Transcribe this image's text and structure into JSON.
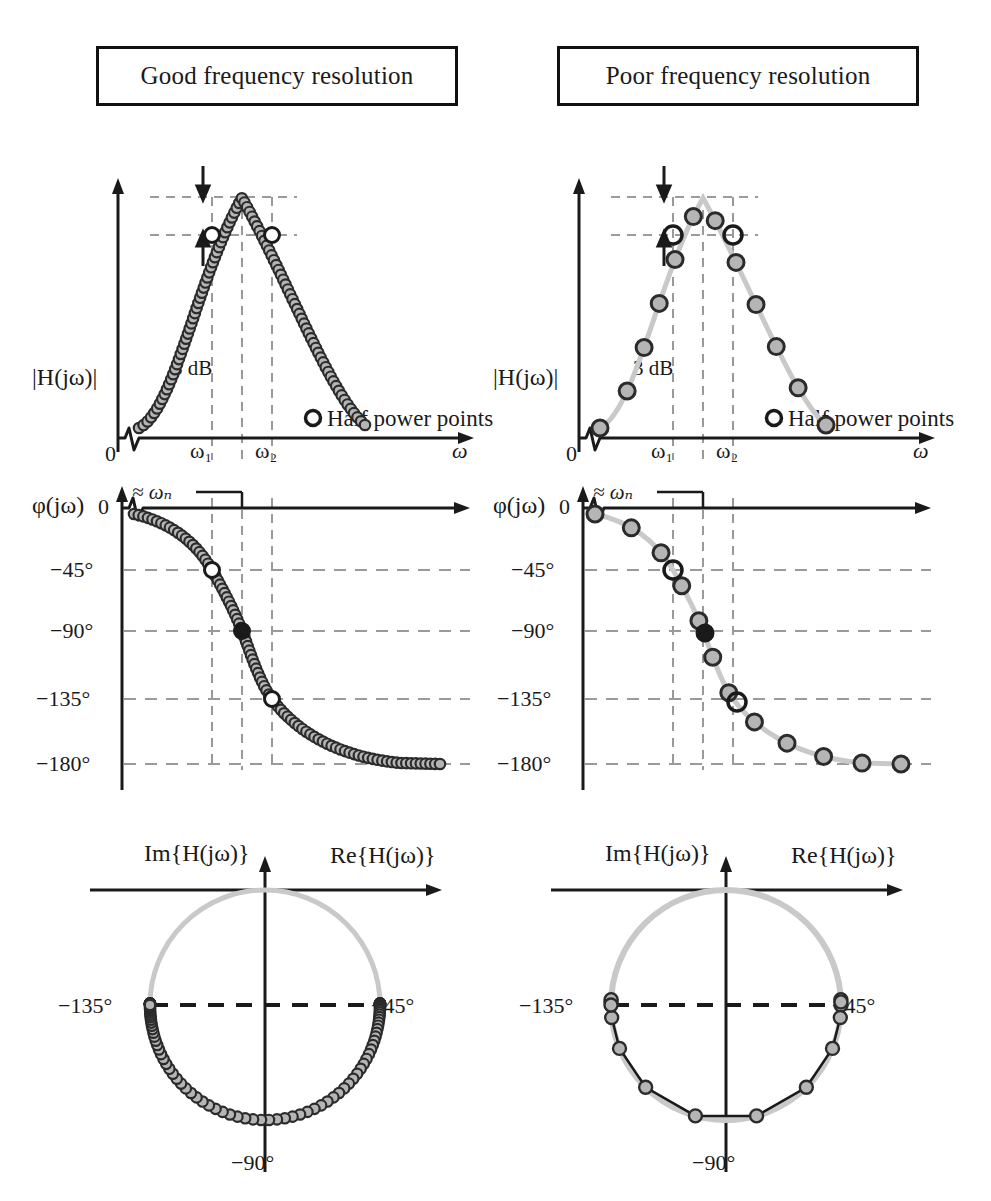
{
  "figure": {
    "kind": "two-column frequency-response comparison",
    "columns": [
      {
        "title": "Good frequency resolution"
      },
      {
        "title": "Poor frequency resolution"
      }
    ]
  },
  "labels": {
    "magnitude_axis": "|H(jω)|",
    "phase_axis": "φ(jω)",
    "omega_axis": "ω",
    "omega_1": "ω₁",
    "omega_2": "ω₂",
    "zero": "0",
    "phase_zero": "0",
    "three_db": "3 dB",
    "approx_wn": "≈ ωₙ",
    "legend_half_power": "Half power points",
    "im_axis": "Im{H(jω)}",
    "re_axis": "Re{H(jω)}",
    "deg_45": "−45°",
    "deg_90": "−90°",
    "deg_135": "−135°",
    "deg_180": "−180°"
  },
  "colors": {
    "ink": "#1a1a1a",
    "curve_light": "#c9c9c9",
    "marker_fill": "#b5b5b5",
    "marker_edge": "#2b2b2b",
    "grid_dash": "#9a9a9a",
    "highlight_fill": "#ffffff",
    "dark_marker": "#1a1a1a"
  },
  "chart_data": [
    {
      "id": "magnitude-good",
      "type": "line",
      "title": "Good frequency resolution — magnitude",
      "xlabel": "ω",
      "ylabel": "|H(jω)|",
      "xtick_labels": [
        "0",
        "ω₁",
        "ω₂",
        "ω"
      ],
      "annotations": [
        "3 dB",
        "Half power points"
      ],
      "resonance_shape": "lightly damped second-order peak",
      "sample_count": 96,
      "half_power_x": [
        0.4,
        0.56
      ],
      "peak_x": 0.48,
      "half_power_level": 0.707,
      "peak_level": 1.0,
      "notes": "dense sampling resolves the peak and both half-power points"
    },
    {
      "id": "magnitude-poor",
      "type": "line",
      "title": "Poor frequency resolution — magnitude",
      "xlabel": "ω",
      "ylabel": "|H(jω)|",
      "xtick_labels": [
        "0",
        "ω₁",
        "ω₂",
        "ω"
      ],
      "annotations": [
        "3 dB",
        "Half power points"
      ],
      "sample_count": 12,
      "half_power_x": [
        0.4,
        0.56
      ],
      "peak_x": 0.48,
      "half_power_level": 0.707,
      "peak_level": 1.0,
      "notes": "coarse sampling misses the true peak; samples straddle the 3 dB band"
    },
    {
      "id": "phase-good",
      "type": "line",
      "title": "Good frequency resolution — phase",
      "xlabel": "ω",
      "ylabel": "φ(jω)",
      "ytick_labels": [
        "0",
        "−45°",
        "−90°",
        "−135°",
        "−180°"
      ],
      "ylim": [
        -180,
        0
      ],
      "grid": true,
      "annotations": [
        "≈ ωₙ"
      ],
      "sample_count": 90,
      "marked_phases": [
        -45,
        -90,
        -135
      ]
    },
    {
      "id": "phase-poor",
      "type": "line",
      "title": "Poor frequency resolution — phase",
      "xlabel": "ω",
      "ylabel": "φ(jω)",
      "ytick_labels": [
        "0",
        "−45°",
        "−90°",
        "−135°",
        "−180°"
      ],
      "ylim": [
        -180,
        0
      ],
      "grid": true,
      "annotations": [
        "≈ ωₙ"
      ],
      "sample_count": 12,
      "marked_phases": [
        -45,
        -90,
        -135
      ]
    },
    {
      "id": "nyquist-good",
      "type": "scatter",
      "title": "Good frequency resolution — Nyquist locus",
      "xlabel": "Re{H(jω)}",
      "ylabel": "Im{H(jω)}",
      "annotations": [
        "−45°",
        "−90°",
        "−135°"
      ],
      "sample_count": 96,
      "shape": "circle in lower half plane",
      "notes": "dense points trace the full circle"
    },
    {
      "id": "nyquist-poor",
      "type": "scatter",
      "title": "Poor frequency resolution — Nyquist locus",
      "xlabel": "Re{H(jω)}",
      "ylabel": "Im{H(jω)}",
      "annotations": [
        "−45°",
        "−90°",
        "−135°"
      ],
      "sample_count": 14,
      "shape": "polygon chords cutting across the circle",
      "notes": "sparse points joined by straight chords depart from the circle"
    }
  ]
}
